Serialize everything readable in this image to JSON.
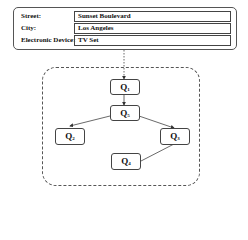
{
  "form": {
    "rows": [
      {
        "label": "Street:",
        "value": "Sunset Boulevard"
      },
      {
        "label": "City:",
        "value": "Los Angeles"
      },
      {
        "label": "Electronic Device:",
        "value": "TV Set"
      }
    ]
  },
  "diagram": {
    "nodes": [
      {
        "id": "Q1",
        "letter": "Q",
        "sub": "1"
      },
      {
        "id": "Q5",
        "letter": "Q",
        "sub": "5"
      },
      {
        "id": "Q2",
        "letter": "Q",
        "sub": "2"
      },
      {
        "id": "Q3",
        "letter": "Q",
        "sub": "3"
      },
      {
        "id": "Q4",
        "letter": "Q",
        "sub": "4"
      }
    ],
    "edges": [
      {
        "from": "form",
        "to": "Q1",
        "style": "dashed"
      },
      {
        "from": "Q1",
        "to": "Q5",
        "style": "solid"
      },
      {
        "from": "Q5",
        "to": "Q2",
        "style": "solid"
      },
      {
        "from": "Q5",
        "to": "Q3",
        "style": "solid"
      },
      {
        "from": "Q3",
        "to": "Q4",
        "style": "solid"
      }
    ]
  }
}
